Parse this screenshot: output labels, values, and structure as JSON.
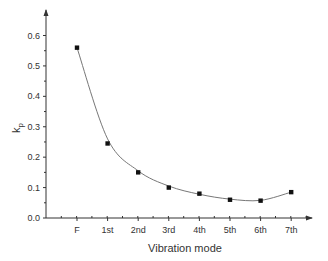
{
  "chart_data": {
    "type": "scatter",
    "title": "",
    "xlabel": "Vibration mode",
    "ylabel": "k",
    "ylabel_subscript": "p",
    "categories": [
      "F",
      "1st",
      "2nd",
      "3rd",
      "4th",
      "5th",
      "6th",
      "7th"
    ],
    "series": [
      {
        "name": "kp",
        "marker": "square",
        "values": [
          0.56,
          0.245,
          0.15,
          0.1,
          0.08,
          0.06,
          0.057,
          0.085
        ],
        "fit_curve": "smooth polynomial fit"
      }
    ],
    "y_ticks": [
      "0.0",
      "0.1",
      "0.2",
      "0.3",
      "0.4",
      "0.5",
      "0.6"
    ],
    "ylim": [
      0.0,
      0.65
    ],
    "grid": false,
    "legend": null,
    "colors": {
      "marker": "#111111",
      "curve": "#777777",
      "axis": "#333333"
    }
  }
}
